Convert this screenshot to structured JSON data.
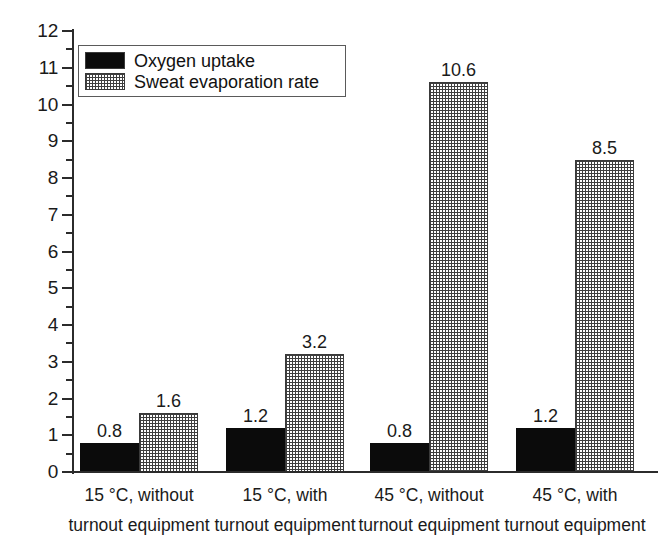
{
  "chart_data": {
    "type": "bar",
    "title": "",
    "subtitle": "",
    "xlabel": "",
    "ylabel": "",
    "ylim": [
      0,
      12
    ],
    "y_ticks_major": [
      0,
      1,
      2,
      3,
      4,
      5,
      6,
      7,
      8,
      9,
      10,
      11,
      12
    ],
    "y_tick_labels": [
      "0",
      "1",
      "2",
      "3",
      "4",
      "5",
      "6",
      "7",
      "8",
      "9",
      "10",
      "11",
      "12"
    ],
    "y_minor_tick_interval": 0.5,
    "grid": false,
    "legend_position": "top-left",
    "categories": [
      "15 °C, without turnout equipment",
      "15 °C, with turnout equipment",
      "45 °C, without turnout equipment",
      "45 °C, with turnout equipment"
    ],
    "category_lines": [
      {
        "line1": "15 °C, without",
        "line2": "turnout equipment"
      },
      {
        "line1": "15 °C, with",
        "line2": "turnout equipment"
      },
      {
        "line1": "45 °C, without",
        "line2": "turnout equipment"
      },
      {
        "line1": "45 °C, with",
        "line2": "turnout equipment"
      }
    ],
    "series": [
      {
        "name": "Oxygen uptake",
        "fill": "solid-black",
        "color": "#0b0b0b",
        "values": [
          0.8,
          1.2,
          0.8,
          1.2
        ],
        "value_labels": [
          "0.8",
          "1.2",
          "0.8",
          "1.2"
        ]
      },
      {
        "name": "Sweat evaporation rate",
        "fill": "crosshatch-grid",
        "color": "#3f3f3f",
        "values": [
          1.6,
          3.2,
          10.6,
          8.5
        ],
        "value_labels": [
          "1.6",
          "3.2",
          "10.6",
          "8.5"
        ]
      }
    ]
  },
  "legend": {
    "items": [
      {
        "label": "Oxygen uptake",
        "swatch": "solid-black-swatch"
      },
      {
        "label": "Sweat evaporation rate",
        "swatch": "crosshatch-grid-swatch"
      }
    ]
  },
  "axis": {
    "y_labels": [
      "12",
      "11",
      "10",
      "9",
      "8",
      "7",
      "6",
      "5",
      "4",
      "3",
      "2",
      "1",
      "0"
    ]
  },
  "colors": {
    "background": "#ffffff",
    "axis": "#2b2b2b",
    "text": "#1a1a1a",
    "series_oxygen": "#0b0b0b",
    "series_sweat": "#3f3f3f"
  }
}
